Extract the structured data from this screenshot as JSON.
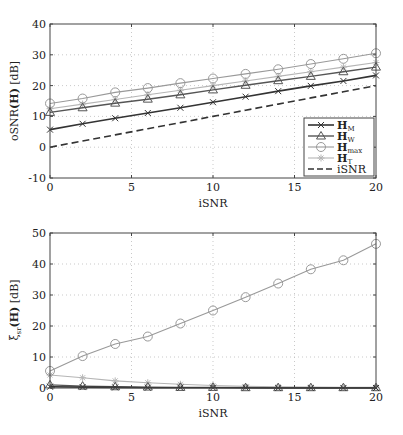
{
  "chart_data": [
    {
      "type": "line",
      "title": "",
      "xlabel": "iSNR",
      "ylabel": "oSNR(H) [dB]",
      "xlim": [
        0,
        20
      ],
      "ylim": [
        -10,
        40
      ],
      "xticks": [
        0,
        5,
        10,
        15,
        20
      ],
      "yticks": [
        -10,
        0,
        10,
        20,
        30,
        40
      ],
      "grid": true,
      "legend_position": "lower right",
      "x": [
        0,
        2,
        4,
        6,
        8,
        10,
        12,
        14,
        16,
        18,
        20
      ],
      "series": [
        {
          "name": "H_M",
          "label_main": "H",
          "label_sub": "M",
          "marker": "x",
          "color": "#333333",
          "width": 1.6,
          "dash": "",
          "values": [
            5.7,
            7.6,
            9.4,
            11.1,
            12.8,
            14.6,
            16.4,
            18.2,
            19.9,
            21.5,
            23.3
          ]
        },
        {
          "name": "H_W",
          "label_main": "H",
          "label_sub": "W",
          "marker": "triangle",
          "color": "#555555",
          "width": 1.4,
          "dash": "",
          "values": [
            11.3,
            12.8,
            14.3,
            15.6,
            17.0,
            18.6,
            20.1,
            21.6,
            23.0,
            24.5,
            26.0
          ]
        },
        {
          "name": "H_max",
          "label_main": "H",
          "label_sub": "max",
          "marker": "circle",
          "color": "#999999",
          "width": 1.1,
          "dash": "",
          "values": [
            14.2,
            15.8,
            17.8,
            19.2,
            20.8,
            22.3,
            23.8,
            25.3,
            27.0,
            28.7,
            30.5
          ]
        },
        {
          "name": "H_T",
          "label_main": "H",
          "label_sub": "T",
          "marker": "star",
          "color": "#b5b5b5",
          "width": 1.1,
          "dash": "",
          "values": [
            12.5,
            14.0,
            15.5,
            17.0,
            18.5,
            20.0,
            21.5,
            23.0,
            24.5,
            26.0,
            27.5
          ]
        },
        {
          "name": "iSNR",
          "label_main": "iSNR",
          "label_sub": "",
          "marker": "none",
          "color": "#333333",
          "width": 1.6,
          "dash": "7,4",
          "values": [
            0,
            2,
            4,
            6,
            8,
            10,
            12,
            14,
            16,
            18,
            20
          ]
        }
      ]
    },
    {
      "type": "line",
      "title": "",
      "xlabel": "iSNR",
      "ylabel": "ξsr(H) [dB]",
      "xlim": [
        0,
        20
      ],
      "ylim": [
        0,
        50
      ],
      "xticks": [
        0,
        5,
        10,
        15,
        20
      ],
      "yticks": [
        0,
        10,
        20,
        30,
        40,
        50
      ],
      "grid": true,
      "x": [
        0,
        2,
        4,
        6,
        8,
        10,
        12,
        14,
        16,
        18,
        20
      ],
      "series": [
        {
          "name": "H_M",
          "marker": "x",
          "color": "#333333",
          "width": 1.6,
          "values": [
            0.4,
            0.3,
            0.2,
            0.1,
            0.1,
            0.1,
            0.1,
            0.0,
            0.0,
            0.0,
            0.0
          ]
        },
        {
          "name": "H_W",
          "marker": "triangle",
          "color": "#555555",
          "width": 1.4,
          "values": [
            1.0,
            0.6,
            0.4,
            0.3,
            0.2,
            0.2,
            0.1,
            0.1,
            0.1,
            0.1,
            0.1
          ]
        },
        {
          "name": "H_max",
          "marker": "circle",
          "color": "#999999",
          "width": 1.1,
          "values": [
            5.5,
            10.3,
            14.2,
            16.6,
            20.8,
            25.0,
            29.3,
            33.7,
            38.3,
            41.2,
            46.5
          ]
        },
        {
          "name": "H_T",
          "marker": "star",
          "color": "#b5b5b5",
          "width": 1.1,
          "values": [
            4.2,
            3.3,
            2.3,
            1.7,
            1.2,
            0.8,
            0.5,
            0.4,
            0.3,
            0.2,
            0.2
          ]
        }
      ]
    }
  ],
  "layout": {
    "plots": [
      {
        "left": 50,
        "right": 376,
        "top": 24,
        "bottom": 178
      },
      {
        "left": 50,
        "right": 376,
        "top": 233,
        "bottom": 388
      }
    ]
  },
  "labels": {
    "top_xlabel": "iSNR",
    "top_ylabel_prefix": "oSNR",
    "top_ylabel_arg": "(H)",
    "top_ylabel_unit": "[dB]",
    "bottom_xlabel": "iSNR",
    "bottom_ylabel_prefix": "ξ",
    "bottom_ylabel_sub": "sr",
    "bottom_ylabel_arg": "(H)",
    "bottom_ylabel_unit": "[dB]"
  }
}
